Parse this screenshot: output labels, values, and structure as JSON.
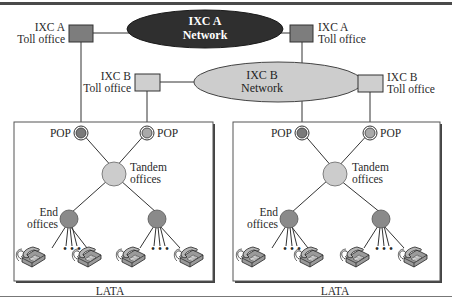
{
  "colors": {
    "ixc_a_office": "#7d7d7d",
    "ixc_a_network": "#2f2f2f",
    "ixc_b_office": "#cfcfcf",
    "ixc_b_network": "#cdcdcd",
    "pop_a": "#7a7a7a",
    "pop_b": "#a9a9a9",
    "tandem": "#cccccc",
    "end_office": "#8a8a8a",
    "line": "#333333",
    "rule": "#555555"
  },
  "networks": {
    "ixc_a": {
      "line1": "IXC A",
      "line2": "Network"
    },
    "ixc_b": {
      "line1": "IXC B",
      "line2": "Network"
    }
  },
  "toll_offices": {
    "ixc_a_left": {
      "line1": "IXC A",
      "line2": "Toll office"
    },
    "ixc_a_right": {
      "line1": "IXC A",
      "line2": "Toll office"
    },
    "ixc_b_left": {
      "line1": "IXC B",
      "line2": "Toll office"
    },
    "ixc_b_right": {
      "line1": "IXC B",
      "line2": "Toll office"
    }
  },
  "latas": [
    {
      "label": "LATA",
      "pop_left": "POP",
      "pop_right": "POP",
      "tandem_line1": "Tandem",
      "tandem_line2": "offices",
      "end_line1": "End",
      "end_line2": "offices",
      "ellipsis_left": "• • •",
      "ellipsis_right": "• • •"
    },
    {
      "label": "LATA",
      "pop_left": "POP",
      "pop_right": "POP",
      "tandem_line1": "Tandem",
      "tandem_line2": "offices",
      "end_line1": "End",
      "end_line2": "offices",
      "ellipsis_left": "• • •",
      "ellipsis_right": "• • •"
    }
  ],
  "icons": {
    "telephone": "telephone-icon"
  }
}
